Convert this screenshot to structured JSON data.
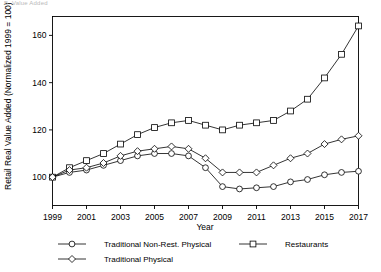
{
  "panel": {
    "label": "B. Value Added"
  },
  "chart_data": {
    "type": "line",
    "title": "B. Value Added",
    "xlabel": "Year",
    "ylabel": "Retail Real Value Added (Normalized 1999 = 100)",
    "xlim": [
      1999,
      2017
    ],
    "ylim": [
      88,
      168
    ],
    "xticks": [
      1999,
      2001,
      2003,
      2005,
      2007,
      2009,
      2011,
      2013,
      2015,
      2017
    ],
    "yticks": [
      100,
      120,
      140,
      160
    ],
    "grid": false,
    "legend_position": "bottom",
    "x": [
      1999,
      2000,
      2001,
      2002,
      2003,
      2004,
      2005,
      2006,
      2007,
      2008,
      2009,
      2010,
      2011,
      2012,
      2013,
      2014,
      2015,
      2016,
      2017
    ],
    "series": [
      {
        "name": "Traditional Non-Rest. Physical",
        "marker": "circle",
        "values": [
          100,
          102,
          103,
          105,
          107,
          109,
          110,
          110,
          109,
          104,
          96,
          95,
          95.5,
          96,
          98,
          99,
          101,
          102,
          102.5
        ]
      },
      {
        "name": "Restaurants",
        "marker": "square",
        "values": [
          100,
          104,
          107,
          110,
          114,
          118,
          121,
          123,
          124,
          122,
          120,
          122,
          123,
          124,
          128,
          133,
          142,
          152,
          164
        ]
      },
      {
        "name": "Traditional Physical",
        "marker": "diamond",
        "values": [
          100,
          103,
          104,
          106,
          109,
          111,
          112,
          113,
          112,
          108,
          102,
          102,
          102,
          105,
          108,
          110,
          114,
          116,
          117.5
        ]
      }
    ]
  },
  "axis": {
    "x_title": "Year",
    "y_title": "Retail Real Value Added (Normalized 1999 = 100)",
    "xticklabels": [
      "1999",
      "2001",
      "2003",
      "2005",
      "2007",
      "2009",
      "2011",
      "2013",
      "2015",
      "2017"
    ],
    "yticklabels": [
      "100",
      "120",
      "140",
      "160"
    ]
  },
  "legend": {
    "entries": [
      {
        "label": "Traditional Non-Rest. Physical",
        "marker": "circle"
      },
      {
        "label": "Restaurants",
        "marker": "square"
      },
      {
        "label": "Traditional Physical",
        "marker": "diamond"
      }
    ]
  },
  "colors": {
    "ink": "#000000",
    "paper": "#ffffff",
    "faint": "#b9b9b9"
  }
}
